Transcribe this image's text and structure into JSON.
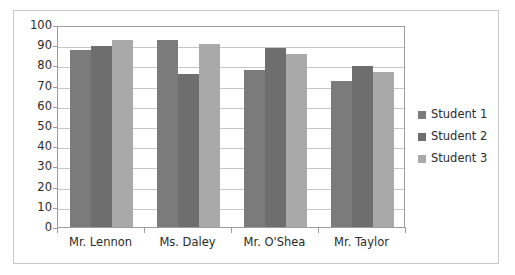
{
  "chart_data": {
    "type": "bar",
    "title": "",
    "subtitle": "",
    "xlabel": "",
    "ylabel": "",
    "ylim": [
      0,
      100
    ],
    "ytick_labels": [
      "100",
      "90",
      "80",
      "70",
      "60",
      "50",
      "40",
      "30",
      "20",
      "10",
      "0"
    ],
    "ytick_values": [
      100,
      90,
      80,
      70,
      60,
      50,
      40,
      30,
      20,
      10,
      0
    ],
    "grid": true,
    "legend_position": "right",
    "categories": [
      "Mr. Lennon",
      "Ms. Daley",
      "Mr. O'Shea",
      "Mr. Taylor"
    ],
    "series": [
      {
        "name": "Student 1",
        "color": "#7b7b7b",
        "values": [
          88,
          93,
          78,
          73
        ]
      },
      {
        "name": "Student 2",
        "color": "#6e6e6e",
        "values": [
          90,
          76,
          89,
          80
        ]
      },
      {
        "name": "Student 3",
        "color": "#a9a9a9",
        "values": [
          93,
          91,
          86,
          77
        ]
      }
    ]
  },
  "legend": {
    "items": [
      {
        "label": "Student 1",
        "color": "#7b7b7b"
      },
      {
        "label": "Student 2",
        "color": "#6e6e6e"
      },
      {
        "label": "Student 3",
        "color": "#a9a9a9"
      }
    ]
  },
  "axis": {
    "y_labels": [
      "100",
      "90",
      "80",
      "70",
      "60",
      "50",
      "40",
      "30",
      "20",
      "10",
      "0"
    ],
    "x_labels": [
      "Mr. Lennon",
      "Ms. Daley",
      "Mr. O'Shea",
      "Mr. Taylor"
    ]
  },
  "colors": {
    "frame_border": "#c9c9c9",
    "axis_line": "#9d9d9d",
    "gridline": "#c6c6c6",
    "text": "#2b2b2b",
    "plot_background": "#ffffff"
  }
}
